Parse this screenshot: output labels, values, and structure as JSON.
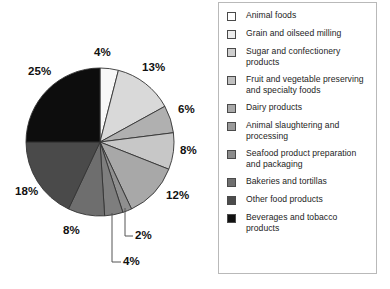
{
  "chart_data": {
    "type": "pie",
    "title": "",
    "subtitle": "",
    "xlabel": "",
    "ylabel": "",
    "legend_position": "right",
    "grid": false,
    "start_angle_deg": 0,
    "direction": "clockwise",
    "units": "percent",
    "categories": [
      "Animal foods",
      "Grain and oilseed milling",
      "Sugar and confectionery products",
      "Fruit and vegetable preserving and specialty foods",
      "Dairy products",
      "Animal slaughtering and processing",
      "Seafood product preparation and packaging",
      "Bakeries and tortillas",
      "Other food products",
      "Beverages and tobacco products"
    ],
    "values": [
      4,
      13,
      6,
      8,
      12,
      2,
      4,
      8,
      18,
      25
    ],
    "data_labels": [
      "4%",
      "13%",
      "6%",
      "8%",
      "12%",
      "2%",
      "4%",
      "8%",
      "18%",
      "25%"
    ],
    "slice_colors": [
      "#f7f7f7",
      "#d9d9d9",
      "#b0b0b0",
      "#c7c7c7",
      "#a8a8a8",
      "#8f8f8f",
      "#7e7e7e",
      "#6e6e6e",
      "#4a4a4a",
      "#0d0d0d"
    ],
    "slice_outline_color": "#333333"
  },
  "legend": {
    "items": [
      {
        "label": "Animal foods",
        "color": "#ffffff"
      },
      {
        "label": "Grain and oilseed milling",
        "color": "#ededed"
      },
      {
        "label": "Sugar and confectionery products",
        "color": "#cfcfcf"
      },
      {
        "label": "Fruit and vegetable preserving and specialty foods",
        "color": "#c0c0c0"
      },
      {
        "label": "Dairy products",
        "color": "#a9a9a9"
      },
      {
        "label": "Animal slaughtering and processing",
        "color": "#9a9a9a"
      },
      {
        "label": "Seafood product preparation and packaging",
        "color": "#8c8c8c"
      },
      {
        "label": "Bakeries and tortillas",
        "color": "#6f6f6f"
      },
      {
        "label": "Other food products",
        "color": "#4c4c4c"
      },
      {
        "label": "Beverages and tobacco products",
        "color": "#111111"
      }
    ]
  }
}
